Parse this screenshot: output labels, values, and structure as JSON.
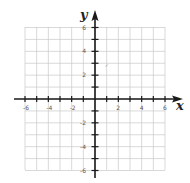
{
  "diagram": {
    "type": "coordinate-plane",
    "x_axis": {
      "label": "x",
      "min": -6,
      "max": 6,
      "tick_step": 1,
      "labeled_ticks": [
        "-6",
        "-4",
        "-2",
        "2",
        "4",
        "6"
      ]
    },
    "y_axis": {
      "label": "y",
      "min": -6,
      "max": 6,
      "tick_step": 1,
      "labeled_ticks": [
        "6",
        "4",
        "2",
        "-2",
        "-4",
        "-6"
      ]
    },
    "grid": {
      "cells_x": 12,
      "cells_y": 12,
      "color": "#c8c8c8"
    },
    "axis_color": "#1a1a1a",
    "marks": [
      {
        "x": 1,
        "y": 2.8,
        "note": "faint stray mark"
      }
    ]
  }
}
